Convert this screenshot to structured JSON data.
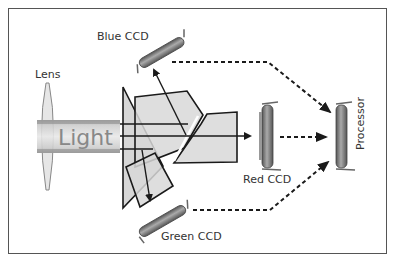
{
  "labels": {
    "lens": "Lens",
    "light": "Light",
    "blue_ccd": "Blue CCD",
    "red_ccd": "Red CCD",
    "green_ccd": "Green CCD",
    "processor": "Processor"
  },
  "colors": {
    "prism_fill": "#d8d8d8",
    "outline": "#1a1a1a",
    "ccd_body": "#777777",
    "light_beam": "#bbbbbb",
    "frame": "#555555"
  }
}
